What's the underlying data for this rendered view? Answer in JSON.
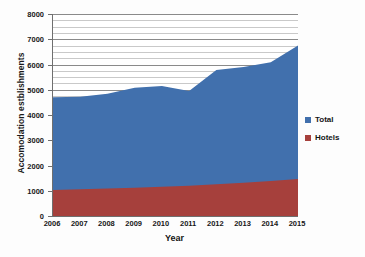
{
  "chart_data": {
    "type": "area",
    "title": "",
    "xlabel": "Year",
    "ylabel": "Accomodation estblishments",
    "categories": [
      "2006",
      "2007",
      "2008",
      "2009",
      "2010",
      "2011",
      "2012",
      "2013",
      "2014",
      "2015"
    ],
    "x": [
      2006,
      2007,
      2008,
      2009,
      2010,
      2011,
      2012,
      2013,
      2014,
      2015
    ],
    "series": [
      {
        "name": "Total",
        "color": "#4170ad",
        "values": [
          4700,
          4720,
          4840,
          5080,
          5150,
          4950,
          5780,
          5900,
          6090,
          6750
        ]
      },
      {
        "name": "Hotels",
        "color": "#a6403c",
        "values": [
          1030,
          1060,
          1090,
          1120,
          1160,
          1200,
          1260,
          1320,
          1390,
          1470
        ]
      }
    ],
    "ylim": [
      0,
      8000
    ],
    "yticks": [
      0,
      1000,
      2000,
      3000,
      4000,
      5000,
      6000,
      7000,
      8000
    ],
    "ytick_labels": [
      "0",
      "1000",
      "2000",
      "3000",
      "4000",
      "5000",
      "6000",
      "7000",
      "8000"
    ],
    "xlim": [
      2006,
      2015
    ],
    "grid": true,
    "grid_minor_step": 250,
    "legend_position": "right",
    "legend": [
      "Total",
      "Hotels"
    ],
    "stacked": true
  },
  "axes": {
    "y_title": "Accomodation estblishments",
    "x_title": "Year"
  },
  "legend": {
    "items": [
      {
        "label": "Total",
        "color": "#4170ad"
      },
      {
        "label": "Hotels",
        "color": "#a6403c"
      }
    ]
  },
  "colors": {
    "total": "#4170ad",
    "hotels": "#a6403c",
    "axis": "#6f6f6f",
    "gridline": "#c9c9c9",
    "gridline_major": "#8a8a8a",
    "background": "#fdfdfd",
    "plot_background": "#ffffff",
    "text": "#171717"
  }
}
